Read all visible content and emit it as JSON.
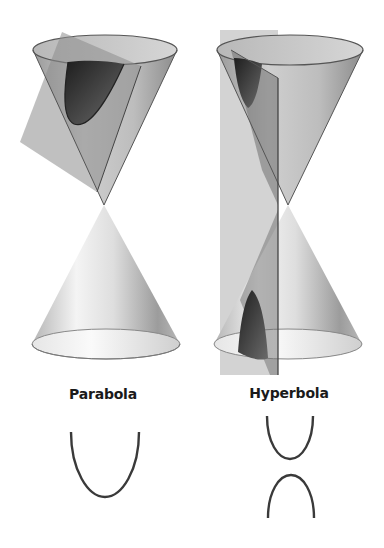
{
  "figure": {
    "panels": [
      {
        "id": "parabola",
        "label": "Parabola",
        "description": "Double cone cut by a tilted plane parallel to a side of the cone",
        "curve_shape": "single open U-shaped curve"
      },
      {
        "id": "hyperbola",
        "label": "Hyperbola",
        "description": "Double cone cut by a vertical plane intersecting both nappes",
        "curve_shape": "two opposing branches"
      }
    ]
  },
  "colors": {
    "background": "#ffffff",
    "cone_light": "#f2f2f2",
    "cone_mid": "#c8c8c8",
    "cone_dark": "#8a8a8a",
    "plane": "#9a9a9a",
    "section": "#2e2e2e",
    "curve_stroke": "#3a3a3a",
    "label_text": "#1a1a1a"
  }
}
